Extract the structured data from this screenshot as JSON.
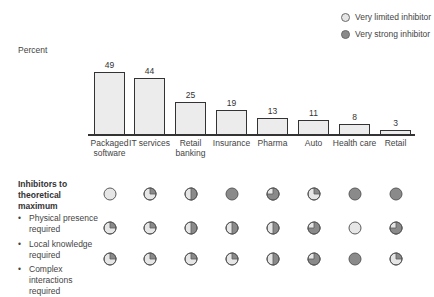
{
  "legend": [
    {
      "label": "Very limited inhibitor",
      "color": "#e6e6e6"
    },
    {
      "label": "Very strong inhibitor",
      "color": "#8a8a8a"
    }
  ],
  "colors": {
    "bar_fill": "#ececec",
    "bar_stroke": "#333333",
    "ball_empty": "#e6e6e6",
    "ball_filled": "#8a8a8a"
  },
  "chart_data": {
    "type": "bar",
    "title": "",
    "ylabel": "Percent",
    "xlabel": "",
    "categories": [
      "Packaged software",
      "IT services",
      "Retail banking",
      "Insurance",
      "Pharma",
      "Auto",
      "Health care",
      "Retail"
    ],
    "values": [
      49,
      44,
      25,
      19,
      13,
      11,
      8,
      3
    ],
    "ylim": [
      0,
      50
    ],
    "grid": false,
    "legend_position": "top-right",
    "inhibitors": {
      "title": "Inhibitors to theoretical maximum",
      "scale": "0 = very limited inhibitor (empty), 4 = very strong inhibitor (full)",
      "rows": [
        {
          "label": "Physical presence required",
          "levels": [
            0,
            1,
            2,
            4,
            3,
            1,
            4,
            4
          ]
        },
        {
          "label": "Local knowledge required",
          "levels": [
            1,
            1,
            2,
            2,
            2,
            3,
            0,
            3
          ]
        },
        {
          "label": "Complex interactions required",
          "levels": [
            1,
            1,
            1,
            1,
            2,
            3,
            4,
            1
          ]
        }
      ]
    }
  },
  "labels": {
    "ylabel": "Percent",
    "section_title": "Inhibitors to theoretical maximum",
    "bullet": "•",
    "categories_display": [
      [
        "Packaged",
        "software"
      ],
      [
        "IT services",
        ""
      ],
      [
        "Retail",
        "banking"
      ],
      [
        "Insurance",
        ""
      ],
      [
        "Pharma",
        ""
      ],
      [
        "Auto",
        ""
      ],
      [
        "Health care",
        ""
      ],
      [
        "Retail",
        ""
      ]
    ],
    "value_labels": [
      "49",
      "44",
      "25",
      "19",
      "13",
      "11",
      "8",
      "3"
    ],
    "row_labels": [
      "Physical presence required",
      "Local knowledge required",
      "Complex interactions required"
    ]
  }
}
